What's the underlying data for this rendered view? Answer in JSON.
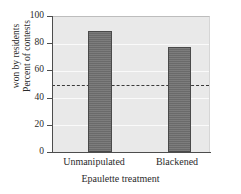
{
  "figure": {
    "faint_title": "",
    "background_color": "#ffffff",
    "plot_background_color": "#e9e9e9",
    "bar_color": "#6e6e6e",
    "bar_border_color": "#4a4a4a",
    "gridline_color": "#fafafa",
    "reference_line_color": "#3a3a3a",
    "axis_color": "#4d4d4d"
  },
  "chart_data": {
    "type": "bar",
    "title": "",
    "xlabel": "Epaulette treatment",
    "ylabel": "Percent of contests won by residents",
    "ylabel_line1": "Percent of contests",
    "ylabel_line2": "won by residents",
    "categories": [
      "Unmanipulated",
      "Blackened"
    ],
    "values": [
      90,
      78
    ],
    "ylim": [
      0,
      100
    ],
    "yticks": [
      0,
      20,
      40,
      60,
      80,
      100
    ],
    "ytick_labels": [
      "0",
      "20",
      "40",
      "60",
      "80",
      "100"
    ],
    "grid": true,
    "legend": false,
    "annotations": [
      {
        "type": "reference-line",
        "orientation": "horizontal",
        "value": 50,
        "style": "dashed",
        "label": ""
      }
    ]
  }
}
